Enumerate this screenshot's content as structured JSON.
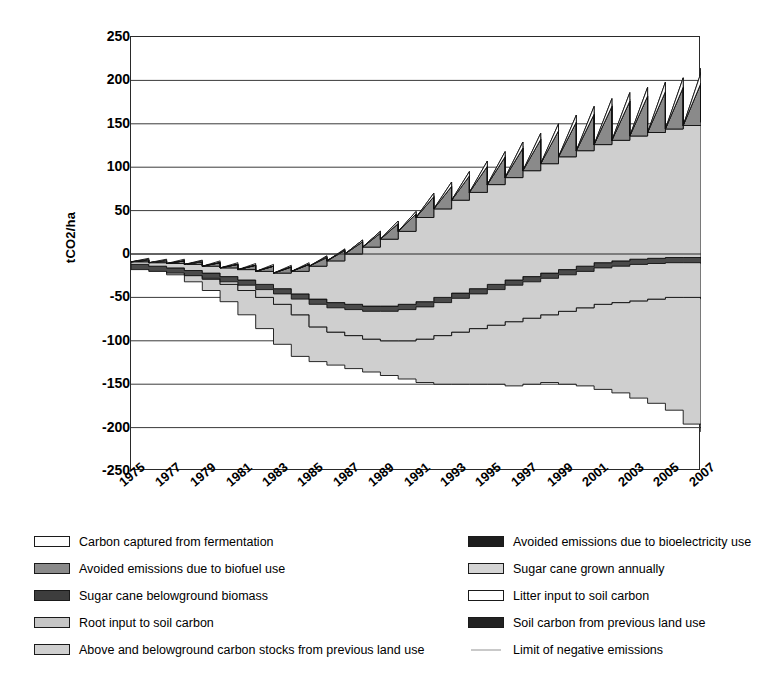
{
  "chart_data": {
    "type": "area",
    "title": "",
    "xlabel": "",
    "ylabel": "tCO2/ha",
    "ylim": [
      -250,
      250
    ],
    "ytick_step": 50,
    "yticks": [
      250,
      200,
      150,
      100,
      50,
      0,
      -50,
      -100,
      -150,
      -200,
      -250
    ],
    "ytick_labels": [
      "250",
      "200",
      "150",
      "100",
      "50",
      "0",
      "-50",
      "-100",
      "-150",
      "-200",
      "-250"
    ],
    "grid": "horizontal",
    "legend_position": "below",
    "x": [
      1975,
      1976,
      1977,
      1978,
      1979,
      1980,
      1981,
      1982,
      1983,
      1984,
      1985,
      1986,
      1987,
      1988,
      1989,
      1990,
      1991,
      1992,
      1993,
      1994,
      1995,
      1996,
      1997,
      1998,
      1999,
      2000,
      2001,
      2002,
      2003,
      2004,
      2005,
      2006,
      2007
    ],
    "xtick_labels": [
      "1975",
      "1977",
      "1979",
      "1981",
      "1983",
      "1985",
      "1987",
      "1989",
      "1991",
      "1993",
      "1995",
      "1997",
      "1999",
      "2001",
      "2003",
      "2005",
      "2007"
    ],
    "xtick_years": [
      1975,
      1977,
      1979,
      1981,
      1983,
      1985,
      1987,
      1989,
      1991,
      1993,
      1995,
      1997,
      1999,
      2001,
      2003,
      2005,
      2007
    ],
    "series": [
      {
        "name": "Carbon captured from fermentation",
        "swatch": "#fdfdfd",
        "cumulative_top": [
          -9,
          -10,
          -11,
          -12,
          -14,
          -16,
          -18,
          -20,
          -22,
          -20,
          -14,
          -8,
          0,
          8,
          17,
          26,
          42,
          52,
          62,
          71,
          80,
          88,
          96,
          104,
          112,
          119,
          126,
          131,
          136,
          140,
          144,
          148,
          152
        ],
        "annual_peak": [
          3,
          3,
          3,
          4,
          4,
          4,
          5,
          6,
          7,
          8,
          10,
          12,
          14,
          16,
          18,
          20,
          24,
          26,
          28,
          30,
          32,
          34,
          36,
          38,
          40,
          42,
          44,
          45,
          46,
          47,
          48,
          49,
          50
        ]
      },
      {
        "name": "Avoided emissions due to bioelectricity use",
        "swatch": "#1d1d1d",
        "annual_increment": [
          0,
          0,
          0,
          0,
          0,
          0,
          0,
          0,
          0,
          0,
          1,
          1,
          2,
          2,
          3,
          3,
          4,
          5,
          5,
          6,
          6,
          7,
          7,
          8,
          8,
          9,
          9,
          10,
          10,
          11,
          11,
          12,
          12
        ]
      },
      {
        "name": "Avoided emissions due to biofuel use",
        "swatch": "#8a8a8a",
        "annual_increment": [
          2,
          2,
          3,
          3,
          4,
          4,
          5,
          6,
          7,
          8,
          10,
          12,
          14,
          16,
          18,
          20,
          24,
          26,
          28,
          30,
          32,
          34,
          36,
          38,
          40,
          42,
          44,
          45,
          46,
          47,
          48,
          49,
          50
        ]
      },
      {
        "name": "Sugar cane grown annually",
        "swatch": "#d4d4d4",
        "annual_increment": [
          4,
          4,
          5,
          5,
          6,
          6,
          7,
          8,
          9,
          10,
          12,
          14,
          16,
          18,
          20,
          22,
          26,
          28,
          30,
          32,
          34,
          36,
          38,
          40,
          42,
          44,
          46,
          47,
          48,
          49,
          50,
          51,
          52
        ]
      },
      {
        "name": "Sugar cane belowground biomass",
        "swatch": "#4a4a4a",
        "cumulative_top": [
          -12,
          -14,
          -16,
          -19,
          -22,
          -26,
          -30,
          -35,
          -40,
          -46,
          -52,
          -56,
          -58,
          -60,
          -60,
          -58,
          -55,
          -50,
          -45,
          -40,
          -35,
          -30,
          -26,
          -22,
          -18,
          -14,
          -10,
          -8,
          -6,
          -5,
          -4,
          -4,
          -5
        ]
      },
      {
        "name": "Litter input to soil carbon",
        "swatch": "#ffffff",
        "annual_increment": [
          1,
          1,
          1,
          2,
          2,
          2,
          3,
          3,
          4,
          4,
          5,
          6,
          7,
          8,
          9,
          10,
          12,
          13,
          14,
          15,
          16,
          17,
          18,
          19,
          20,
          21,
          22,
          23,
          23,
          24,
          24,
          25,
          25
        ]
      },
      {
        "name": "Root input to soil carbon",
        "swatch": "#c6c6c6",
        "annual_increment": [
          1,
          1,
          2,
          2,
          3,
          3,
          4,
          4,
          5,
          6,
          7,
          8,
          9,
          10,
          11,
          12,
          14,
          15,
          16,
          17,
          18,
          19,
          20,
          21,
          22,
          23,
          24,
          25,
          25,
          26,
          26,
          27,
          27
        ]
      },
      {
        "name": "Soil carbon from previous land use",
        "swatch": "#222222",
        "cumulative_bottom": [
          -14,
          -17,
          -20,
          -24,
          -29,
          -35,
          -42,
          -50,
          -58,
          -70,
          -84,
          -90,
          -94,
          -98,
          -100,
          -100,
          -98,
          -94,
          -90,
          -86,
          -82,
          -78,
          -74,
          -70,
          -66,
          -62,
          -58,
          -56,
          -54,
          -52,
          -50,
          -50,
          -52
        ]
      },
      {
        "name": "Above and belowground carbon stocks from previous land use",
        "swatch": "#cfcfcf",
        "cumulative_bottom": [
          -14,
          -18,
          -24,
          -32,
          -42,
          -55,
          -70,
          -86,
          -104,
          -118,
          -124,
          -128,
          -132,
          -136,
          -140,
          -144,
          -148,
          -150,
          -150,
          -150,
          -150,
          -152,
          -150,
          -148,
          -150,
          -152,
          -156,
          -160,
          -166,
          -172,
          -180,
          -196,
          -205
        ]
      },
      {
        "name": "Limit of negative emissions",
        "swatch": "#c9c9c9",
        "style": "line"
      }
    ]
  },
  "axes": {
    "y_axis_title": "tCO2/ha"
  },
  "legend": {
    "left_column": [
      {
        "label": "Carbon captured from fermentation",
        "swatch": "#fdfdfd",
        "type": "box"
      },
      {
        "label": "Avoided emissions due to biofuel use",
        "swatch": "#8a8a8a",
        "type": "box"
      },
      {
        "label": "Sugar cane belowground biomass",
        "swatch": "#3d3d3d",
        "type": "box"
      },
      {
        "label": "Root input to soil carbon",
        "swatch": "#c6c6c6",
        "type": "box"
      },
      {
        "label": "Above and belowground carbon stocks from previous land use",
        "swatch": "#cfcfcf",
        "type": "box"
      }
    ],
    "right_column": [
      {
        "label": "Avoided emissions due to bioelectricity use",
        "swatch": "#1d1d1d",
        "type": "box"
      },
      {
        "label": "Sugar cane  grown annually",
        "swatch": "#d4d4d4",
        "type": "box"
      },
      {
        "label": "Litter input to soil carbon",
        "swatch": "#ffffff",
        "type": "box"
      },
      {
        "label": "Soil carbon from previous land use",
        "swatch": "#222222",
        "type": "box"
      },
      {
        "label": "Limit of negative emissions",
        "swatch": "#c9c9c9",
        "type": "line"
      }
    ]
  }
}
